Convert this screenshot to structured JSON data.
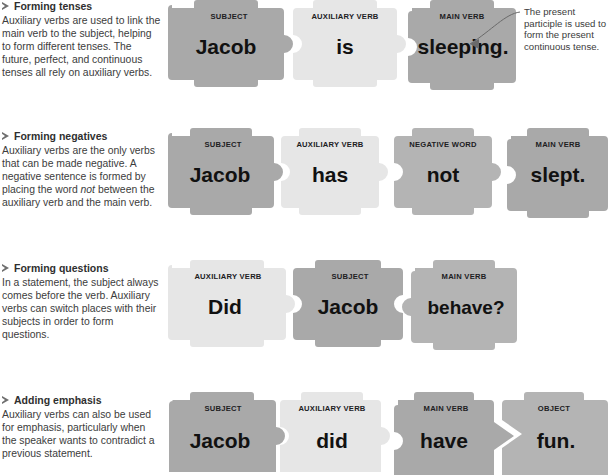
{
  "notes": [
    {
      "id": "forming-tenses",
      "bullet": "triangle-right",
      "heading": "Forming tenses",
      "body": "Auxiliary verbs are used to link the main verb to the subject, helping to form different tenses. The future, perfect, and continuous tenses all rely on auxiliary verbs."
    },
    {
      "id": "forming-negatives",
      "bullet": "triangle-right",
      "heading": "Forming negatives",
      "body_1": "Auxiliary verbs are the only verbs that can be made negative. A negative sentence is formed by placing the word ",
      "body_em": "not",
      "body_2": " between the auxiliary verb and the main verb."
    },
    {
      "id": "forming-questions",
      "bullet": "triangle-right",
      "heading": "Forming questions",
      "body": "In a statement, the subject always comes before the verb. Auxiliary verbs can switch places with their subjects in order to form questions."
    },
    {
      "id": "adding-emphasis",
      "bullet": "triangle-right",
      "heading": "Adding emphasis",
      "body": "Auxiliary verbs can also be used for emphasis, particularly when the speaker wants to contradict a previous statement."
    }
  ],
  "rows": [
    {
      "id": "row-forming-tenses",
      "pieces": [
        {
          "label": "SUBJECT",
          "word": "Jacob",
          "shade": "dark"
        },
        {
          "label": "AUXILIARY VERB",
          "word": "is",
          "shade": "light"
        },
        {
          "label": "MAIN VERB",
          "word": "sleeping.",
          "shade": "dark"
        }
      ]
    },
    {
      "id": "row-forming-negatives",
      "pieces": [
        {
          "label": "SUBJECT",
          "word": "Jacob",
          "shade": "dark"
        },
        {
          "label": "AUXILIARY VERB",
          "word": "has",
          "shade": "light"
        },
        {
          "label": "NEGATIVE WORD",
          "word": "not",
          "shade": "mid"
        },
        {
          "label": "MAIN VERB",
          "word": "slept.",
          "shade": "dark"
        }
      ]
    },
    {
      "id": "row-forming-questions",
      "pieces": [
        {
          "label": "AUXILIARY VERB",
          "word": "Did",
          "shade": "light"
        },
        {
          "label": "SUBJECT",
          "word": "Jacob",
          "shade": "dark"
        },
        {
          "label": "MAIN VERB",
          "word": "behave?",
          "shade": "mid"
        }
      ]
    },
    {
      "id": "row-adding-emphasis",
      "pieces": [
        {
          "label": "SUBJECT",
          "word": "Jacob",
          "shade": "dark"
        },
        {
          "label": "AUXILIARY VERB",
          "word": "did",
          "shade": "light"
        },
        {
          "label": "MAIN VERB",
          "word": "have",
          "shade": "dark"
        },
        {
          "label": "OBJECT",
          "word": "fun.",
          "shade": "mid"
        }
      ]
    }
  ],
  "annotations": [
    {
      "id": "present-participle-note",
      "text": "The present participle is used to form the present continuous tense.",
      "points_to": "sleeping."
    }
  ],
  "colors": {
    "piece_dark": "#a9a9a9",
    "piece_mid": "#b4b4b4",
    "piece_light": "#e6e6e6",
    "text_dark": "#111111",
    "body_text": "#3c3c3c",
    "page_background": "#ffffff"
  }
}
